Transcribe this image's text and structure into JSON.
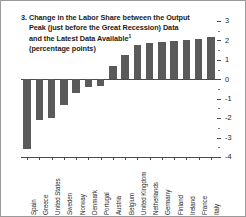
{
  "figure": {
    "number": "3.",
    "title_lines": [
      "3. Change in the Labor Share between the Output",
      "Peak (just before the Great Recession) Data",
      "and the Latest Data Available",
      "(percentage points)"
    ],
    "footnote_marker": "1",
    "accent_color": "#5a5a5a",
    "axis_color": "#4a4a4a",
    "background_color": "#ffffff"
  },
  "chart_data": {
    "type": "bar",
    "subtitle": "(percentage points)",
    "xlabel": "",
    "ylabel": "",
    "ylim": [
      -4,
      3
    ],
    "yticks": [
      3,
      2,
      1,
      0,
      -1,
      -2,
      -3,
      -4
    ],
    "ytick_labels": [
      "3",
      "2",
      "1",
      "0",
      "-1",
      "-2",
      "-3",
      "-4"
    ],
    "y_axis_position": "right",
    "grid": false,
    "legend": false,
    "categories": [
      "Spain",
      "Greece",
      "United States",
      "Sweden",
      "Norway",
      "Denmark",
      "Portugal",
      "Austria",
      "Belgium",
      "United Kingdom",
      "Netherlands",
      "Germany",
      "Finland",
      "Ireland",
      "France",
      "Italy"
    ],
    "values": [
      -3.6,
      -2.1,
      -2.0,
      -1.3,
      -0.7,
      -0.4,
      -0.35,
      0.7,
      1.25,
      1.75,
      1.85,
      1.9,
      1.95,
      2.05,
      2.1,
      2.2
    ]
  }
}
